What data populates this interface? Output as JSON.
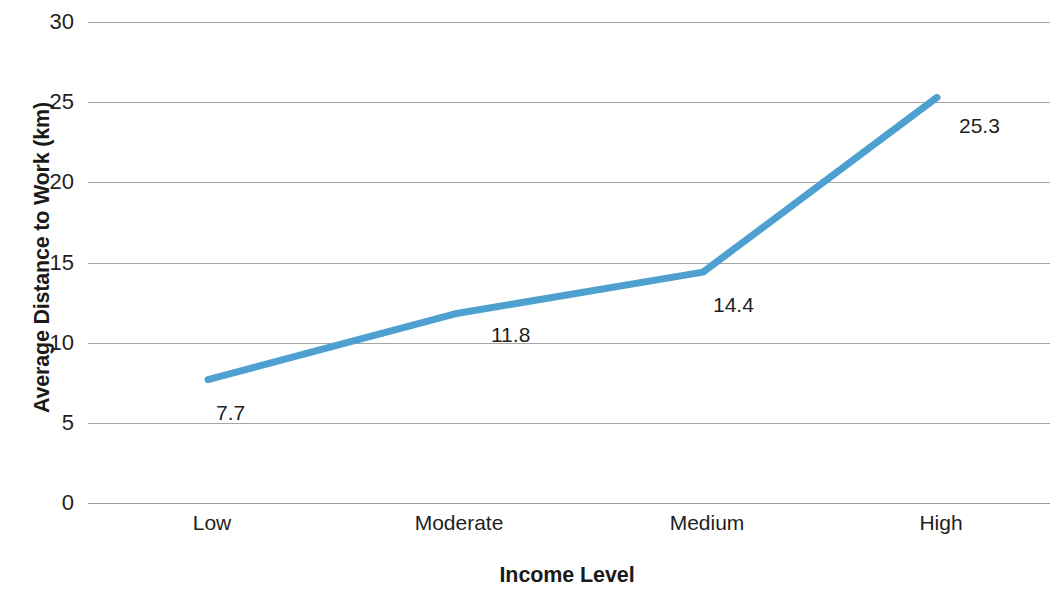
{
  "chart_data": {
    "type": "line",
    "title": "",
    "xlabel": "Income Level",
    "ylabel": "Average Distance to Work (km)",
    "categories": [
      "Low",
      "Moderate",
      "Medium",
      "High"
    ],
    "values": [
      7.7,
      11.8,
      14.4,
      25.3
    ],
    "data_labels": [
      "7.7",
      "11.8",
      "14.4",
      "25.3"
    ],
    "series": [
      {
        "name": "Average Distance to Work (km)",
        "values": [
          7.7,
          11.8,
          14.4,
          25.3
        ],
        "color": "#4EA0D0"
      }
    ],
    "ylim": [
      0,
      30
    ],
    "y_ticks": [
      0,
      5,
      10,
      15,
      20,
      25,
      30
    ],
    "y_tick_labels": [
      "0",
      "5",
      "10",
      "15",
      "20",
      "25",
      "30"
    ],
    "grid": true,
    "grid_axis": "y",
    "grid_color": "#A6A6A6",
    "legend": false,
    "legend_position": "none",
    "background": "#FFFFFF",
    "line_width_px": 7,
    "markers": false
  },
  "axes": {
    "y_title": "Average Distance to Work (km)",
    "x_title": "Income Level"
  }
}
